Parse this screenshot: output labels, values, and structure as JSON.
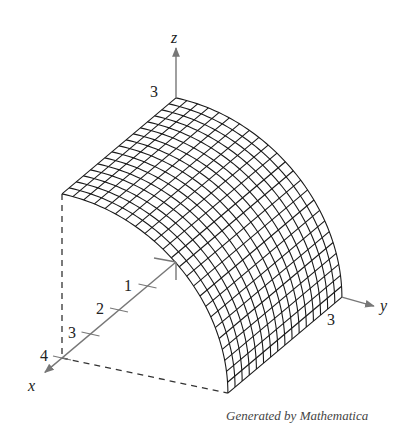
{
  "chart_data": {
    "type": "surface3d",
    "title": "",
    "function_description": "Cylindrical surface z = sqrt(9 - y^2) over 0<=x<=4, 0<=y<=3",
    "axes": {
      "x": {
        "label": "x",
        "ticks": [
          "1",
          "2",
          "3",
          "4"
        ],
        "range": [
          0,
          4
        ]
      },
      "y": {
        "label": "y",
        "ticks": [
          "3"
        ],
        "range": [
          0,
          3
        ]
      },
      "z": {
        "label": "z",
        "ticks": [
          "3"
        ],
        "range": [
          0,
          3
        ]
      }
    },
    "grid": {
      "x_lines": 16,
      "y_lines": 24
    },
    "caption": "Generated by Mathematica",
    "colors": {
      "mesh": "#1a1a1a",
      "axes": "#777777",
      "background": "#ffffff"
    }
  },
  "labels": {
    "z_axis": "z",
    "x_axis": "x",
    "y_axis": "y",
    "z_tick_3": "3",
    "y_tick_3": "3",
    "x_tick_1": "1",
    "x_tick_2": "2",
    "x_tick_3": "3",
    "x_tick_4": "4"
  },
  "caption": "Generated by Mathematica"
}
